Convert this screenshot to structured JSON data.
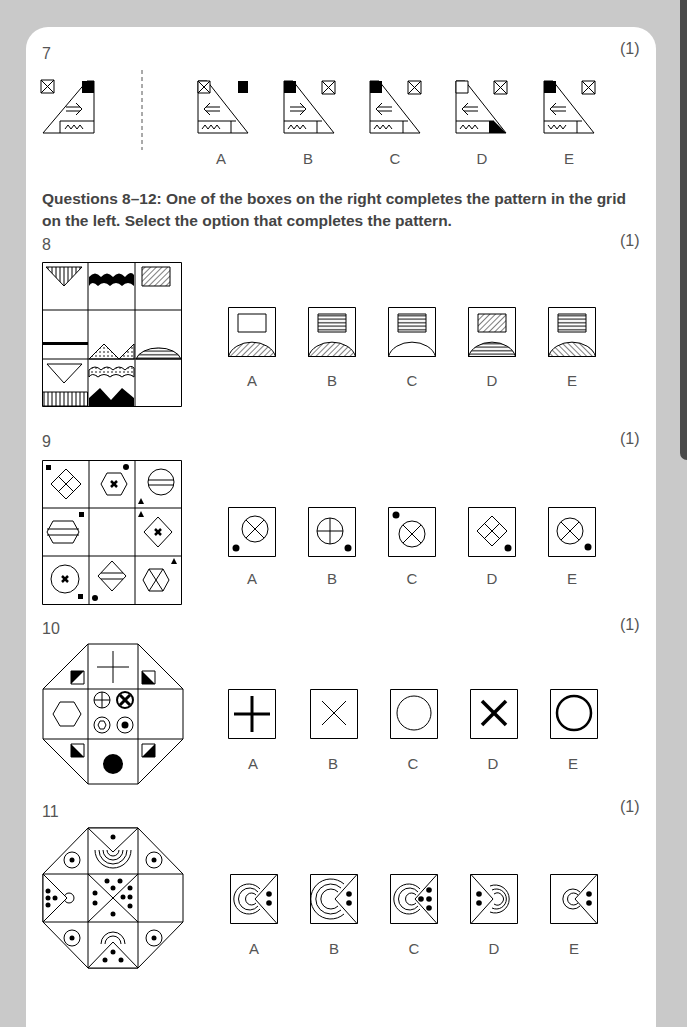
{
  "page": {
    "background_color": "#c9c9c9",
    "card_color": "#ffffff",
    "tab_color": "#4a4a4a"
  },
  "q7": {
    "number": "7",
    "marks": "(1)",
    "options": [
      "A",
      "B",
      "C",
      "D",
      "E"
    ]
  },
  "instructions": {
    "text": "Questions 8–12: One of the boxes on the right completes the pattern in the grid on the left. Select the option that completes the pattern."
  },
  "q8": {
    "number": "8",
    "marks": "(1)",
    "options": [
      "A",
      "B",
      "C",
      "D",
      "E"
    ]
  },
  "q9": {
    "number": "9",
    "marks": "(1)",
    "options": [
      "A",
      "B",
      "C",
      "D",
      "E"
    ]
  },
  "q10": {
    "number": "10",
    "marks": "(1)",
    "options": [
      "A",
      "B",
      "C",
      "D",
      "E"
    ]
  },
  "q11": {
    "number": "11",
    "marks": "(1)",
    "options": [
      "A",
      "B",
      "C",
      "D",
      "E"
    ]
  }
}
